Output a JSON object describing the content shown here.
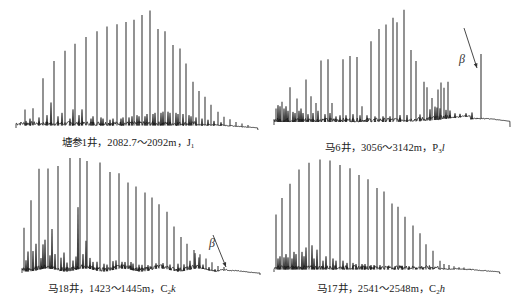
{
  "chart_data": [
    {
      "type": "line",
      "subtype": "chromatogram",
      "title": "塘参1井，2082.7～2092m，J1",
      "well": "塘参1井",
      "depth_range": "2082.7～2092m",
      "formation": "J",
      "formation_sub": "1",
      "formation_suffix": "",
      "annotations": [],
      "peaks_x": [
        25,
        33,
        43,
        54,
        65,
        75,
        86,
        97,
        107,
        117,
        126,
        134,
        142,
        150,
        158,
        165,
        173,
        180,
        186,
        193,
        199,
        205,
        211,
        218,
        224,
        230,
        236,
        242,
        248
      ],
      "peaks_rel_height": [
        14,
        15,
        41,
        56,
        65,
        71,
        77,
        82,
        86,
        88,
        90,
        92,
        96,
        100,
        84,
        82,
        70,
        67,
        54,
        38,
        30,
        25,
        18,
        12,
        8,
        6,
        4,
        3,
        2
      ],
      "minor_peaks": [
        [
          26,
          4
        ],
        [
          30,
          6
        ],
        [
          39,
          7
        ],
        [
          47,
          9
        ],
        [
          51,
          20
        ],
        [
          58,
          8
        ],
        [
          62,
          11
        ],
        [
          70,
          6
        ],
        [
          73,
          14
        ],
        [
          79,
          9
        ],
        [
          82,
          14
        ],
        [
          91,
          6
        ],
        [
          93,
          8
        ],
        [
          101,
          7
        ],
        [
          103,
          6
        ],
        [
          110,
          5
        ],
        [
          113,
          6
        ],
        [
          121,
          6
        ],
        [
          123,
          7
        ],
        [
          129,
          7
        ],
        [
          132,
          8
        ],
        [
          137,
          9
        ],
        [
          139,
          8
        ],
        [
          145,
          8
        ],
        [
          147,
          10
        ],
        [
          153,
          10
        ],
        [
          155,
          11
        ],
        [
          161,
          11
        ],
        [
          163,
          12
        ],
        [
          168,
          12
        ],
        [
          170,
          11
        ],
        [
          176,
          11
        ],
        [
          178,
          10
        ],
        [
          183,
          10
        ],
        [
          189,
          9
        ],
        [
          191,
          8
        ],
        [
          196,
          7
        ],
        [
          202,
          6
        ],
        [
          208,
          5
        ],
        [
          214,
          4
        ],
        [
          221,
          3
        ]
      ],
      "baseline_hump": "none",
      "xlabel": "",
      "ylabel": "",
      "grid": false,
      "legend": "none"
    },
    {
      "type": "line",
      "subtype": "chromatogram",
      "title": "马6井，3056～3142m，P3l",
      "well": "马6井",
      "depth_range": "3056～3142m",
      "formation": "P",
      "formation_sub": "3",
      "formation_suffix": "l",
      "annotations": [
        {
          "label": "β",
          "peak_x": 481,
          "peak_rel_height": 58
        }
      ],
      "peaks_x": [
        276,
        282,
        290,
        297,
        306,
        311,
        316,
        321,
        328,
        332,
        343,
        350,
        357,
        362,
        371,
        379,
        386,
        393,
        397,
        404,
        411,
        416,
        424,
        427,
        432,
        438,
        441,
        444,
        448
      ],
      "peaks_rel_height": [
        12,
        18,
        31,
        21,
        38,
        23,
        17,
        55,
        56,
        17,
        56,
        59,
        58,
        14,
        72,
        83,
        87,
        93,
        89,
        100,
        64,
        54,
        35,
        30,
        20,
        27,
        33,
        28,
        33
      ],
      "minor_peaks": [
        [
          278,
          15
        ],
        [
          280,
          14
        ],
        [
          284,
          12
        ],
        [
          286,
          14
        ],
        [
          288,
          10
        ],
        [
          293,
          9
        ],
        [
          295,
          8
        ],
        [
          299,
          10
        ],
        [
          301,
          12
        ],
        [
          303,
          8
        ],
        [
          308,
          7
        ],
        [
          313,
          8
        ],
        [
          318,
          10
        ],
        [
          325,
          7
        ],
        [
          330,
          8
        ],
        [
          336,
          5
        ],
        [
          340,
          6
        ],
        [
          346,
          6
        ],
        [
          353,
          7
        ],
        [
          360,
          6
        ],
        [
          367,
          6
        ],
        [
          375,
          5
        ],
        [
          383,
          5
        ],
        [
          390,
          5
        ],
        [
          400,
          6
        ],
        [
          407,
          6
        ],
        [
          420,
          6
        ],
        [
          430,
          10
        ],
        [
          435,
          12
        ],
        [
          437,
          11
        ],
        [
          440,
          10
        ],
        [
          446,
          8
        ],
        [
          450,
          7
        ],
        [
          455,
          4
        ],
        [
          460,
          3
        ],
        [
          466,
          3
        ],
        [
          472,
          6
        ]
      ],
      "baseline_hump": "late",
      "xlabel": "",
      "ylabel": "",
      "grid": false,
      "legend": "none"
    },
    {
      "type": "line",
      "subtype": "chromatogram",
      "title": "马18井，1423～1445m，C2k",
      "well": "马18井",
      "depth_range": "1423～1445m",
      "formation": "C",
      "formation_sub": "2",
      "formation_suffix": "k",
      "annotations": [
        {
          "label": "β",
          "peak_x": 230,
          "peak_rel_height": 2
        }
      ],
      "peaks_x": [
        24,
        31,
        39,
        48,
        58,
        70,
        80,
        87,
        100,
        110,
        119,
        128,
        136,
        145,
        152,
        159,
        167,
        174,
        181,
        187,
        194,
        200,
        206,
        212,
        218,
        224
      ],
      "peaks_rel_height": [
        39,
        64,
        91,
        90,
        94,
        102,
        100,
        97,
        98,
        89,
        86,
        78,
        76,
        71,
        65,
        58,
        52,
        40,
        31,
        24,
        17,
        13,
        10,
        8,
        5,
        3
      ],
      "minor_peaks": [
        [
          26,
          10
        ],
        [
          28,
          18
        ],
        [
          33,
          18
        ],
        [
          36,
          24
        ],
        [
          41,
          10
        ],
        [
          43,
          22
        ],
        [
          45,
          26
        ],
        [
          50,
          12
        ],
        [
          52,
          36
        ],
        [
          55,
          14
        ],
        [
          61,
          12
        ],
        [
          64,
          17
        ],
        [
          67,
          8
        ],
        [
          73,
          9
        ],
        [
          76,
          12
        ],
        [
          78,
          56
        ],
        [
          83,
          13
        ],
        [
          86,
          25
        ],
        [
          90,
          10
        ],
        [
          93,
          7
        ],
        [
          97,
          8
        ],
        [
          104,
          7
        ],
        [
          107,
          6
        ],
        [
          113,
          8
        ],
        [
          116,
          8
        ],
        [
          122,
          6
        ],
        [
          125,
          6
        ],
        [
          131,
          7
        ],
        [
          133,
          6
        ],
        [
          139,
          6
        ],
        [
          142,
          6
        ],
        [
          148,
          5
        ],
        [
          156,
          5
        ],
        [
          163,
          5
        ],
        [
          170,
          5
        ],
        [
          178,
          7
        ],
        [
          184,
          6
        ],
        [
          190,
          8
        ],
        [
          195,
          14
        ],
        [
          199,
          10
        ],
        [
          203,
          4
        ],
        [
          209,
          3
        ],
        [
          215,
          2
        ]
      ],
      "baseline_hump": "slight",
      "xlabel": "",
      "ylabel": "",
      "grid": false,
      "legend": "none"
    },
    {
      "type": "line",
      "subtype": "chromatogram",
      "title": "马17井，2541～2548m，C2h",
      "well": "马17井",
      "depth_range": "2541～2548m",
      "formation": "C",
      "formation_sub": "2",
      "formation_suffix": "h",
      "annotations": [],
      "peaks_x": [
        276,
        282,
        290,
        299,
        309,
        320,
        330,
        340,
        350,
        359,
        368,
        377,
        384,
        392,
        398,
        405,
        413,
        420,
        426,
        433,
        440,
        444,
        449,
        454,
        459,
        464,
        470
      ],
      "peaks_rel_height": [
        50,
        65,
        78,
        91,
        97,
        100,
        99,
        95,
        92,
        86,
        82,
        74,
        71,
        60,
        57,
        48,
        40,
        33,
        23,
        17,
        8,
        5,
        4,
        3,
        2,
        2,
        1
      ],
      "minor_peaks": [
        [
          278,
          10
        ],
        [
          280,
          12
        ],
        [
          284,
          11
        ],
        [
          286,
          14
        ],
        [
          288,
          11
        ],
        [
          292,
          10
        ],
        [
          294,
          16
        ],
        [
          296,
          14
        ],
        [
          302,
          16
        ],
        [
          304,
          12
        ],
        [
          306,
          20
        ],
        [
          312,
          22
        ],
        [
          314,
          10
        ],
        [
          317,
          18
        ],
        [
          323,
          8
        ],
        [
          326,
          12
        ],
        [
          333,
          10
        ],
        [
          336,
          8
        ],
        [
          343,
          8
        ],
        [
          347,
          6
        ],
        [
          353,
          6
        ],
        [
          356,
          5
        ],
        [
          362,
          5
        ],
        [
          365,
          5
        ],
        [
          371,
          4
        ],
        [
          374,
          4
        ],
        [
          380,
          4
        ],
        [
          388,
          3
        ],
        [
          395,
          3
        ],
        [
          402,
          3
        ],
        [
          409,
          3
        ],
        [
          416,
          2
        ],
        [
          423,
          2
        ],
        [
          430,
          2
        ]
      ],
      "baseline_hump": "none",
      "xlabel": "",
      "ylabel": "",
      "grid": false,
      "legend": "none"
    }
  ],
  "captions": [
    {
      "well": "塘参1井，",
      "depth": "2082.7～2092m，",
      "formation": "J",
      "sub": "1",
      "suffix": ""
    },
    {
      "well": "马6井，",
      "depth": "3056～3142m，",
      "formation": "P",
      "sub": "3",
      "suffix": "l"
    },
    {
      "well": "马18井，",
      "depth": "1423～1445m，",
      "formation": "C",
      "sub": "2",
      "suffix": "k"
    },
    {
      "well": "马17井，",
      "depth": "2541～2548m，",
      "formation": "C",
      "sub": "2",
      "suffix": "h"
    }
  ],
  "beta_label": "β",
  "colors": {
    "trace": "#1a1a1a",
    "peak": "#3a3a3a",
    "text": "#222222",
    "background": "#ffffff"
  }
}
